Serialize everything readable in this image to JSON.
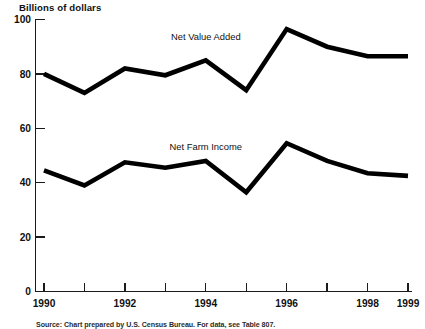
{
  "chart_data": {
    "type": "line",
    "title": "",
    "ylabel": "Billions of dollars",
    "xlabel": "",
    "ylim": [
      0,
      100
    ],
    "yticks": [
      0,
      20,
      40,
      60,
      80,
      100
    ],
    "ytick_labels": [
      "0",
      "20",
      "40",
      "60",
      "80",
      "100"
    ],
    "xlim": [
      1990,
      1999
    ],
    "x": [
      1990,
      1991,
      1992,
      1993,
      1994,
      1995,
      1996,
      1997,
      1998,
      1999
    ],
    "xticks": [
      1990,
      1991,
      1992,
      1993,
      1994,
      1995,
      1996,
      1997,
      1998,
      1999
    ],
    "xtick_labels": [
      "1990",
      "",
      "1992",
      "",
      "1994",
      "",
      "1996",
      "",
      "1998",
      "1999"
    ],
    "grid": false,
    "legend_position": "inline-annotation",
    "series": [
      {
        "name": "Net Value Added",
        "color": "#000000",
        "label_x": 1994.0,
        "label_y": 92.5,
        "values": [
          80.0,
          73.0,
          82.0,
          79.5,
          85.0,
          74.0,
          96.5,
          90.0,
          86.5,
          86.5
        ]
      },
      {
        "name": "Net Farm Income",
        "color": "#000000",
        "label_x": 1994.0,
        "label_y": 52.0,
        "values": [
          44.5,
          39.0,
          47.5,
          45.5,
          48.0,
          36.5,
          54.5,
          48.0,
          43.5,
          42.5
        ]
      }
    ],
    "annotations": [
      "Net Value Added",
      "Net Farm Income"
    ],
    "source": "Source: Chart prepared by U.S. Census Bureau. For data, see Table 807."
  }
}
